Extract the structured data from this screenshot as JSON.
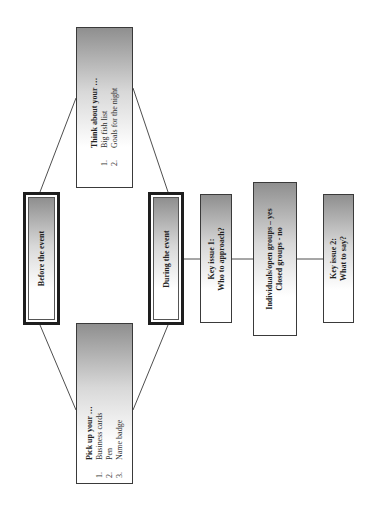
{
  "diagram": {
    "orientation": "rotated-90-ccw",
    "nodes": {
      "before": {
        "label": "Before the event",
        "style": "major"
      },
      "think": {
        "heading": "Think about your …",
        "items": [
          {
            "num": "1.",
            "text": "Big fish list"
          },
          {
            "num": "2.",
            "text": "Goals for the night"
          }
        ]
      },
      "pickup": {
        "heading": "Pick up your …",
        "items": [
          {
            "num": "1.",
            "text": "Business cards"
          },
          {
            "num": "2.",
            "text": "Pen"
          },
          {
            "num": "3.",
            "text": "Name badge"
          }
        ]
      },
      "during": {
        "label": "During the event",
        "style": "major"
      },
      "key1": {
        "line1": "Key issue 1:",
        "line2": "Who to approach?"
      },
      "groups": {
        "line1": "Individuals/open groups – yes",
        "line2": "Closed groups - no"
      },
      "key2": {
        "line1": "Key issue 2:",
        "line2": "What to say?"
      }
    },
    "edges": [
      [
        "before",
        "think"
      ],
      [
        "before",
        "pickup"
      ],
      [
        "think",
        "during"
      ],
      [
        "pickup",
        "during"
      ],
      [
        "during",
        "key1"
      ],
      [
        "key1",
        "groups"
      ],
      [
        "groups",
        "key2"
      ]
    ],
    "colors": {
      "line": "#3a3a3a",
      "major_border": "#1e1e1e",
      "gradient_dark": "#8f8f8f",
      "background": "#ffffff"
    }
  }
}
